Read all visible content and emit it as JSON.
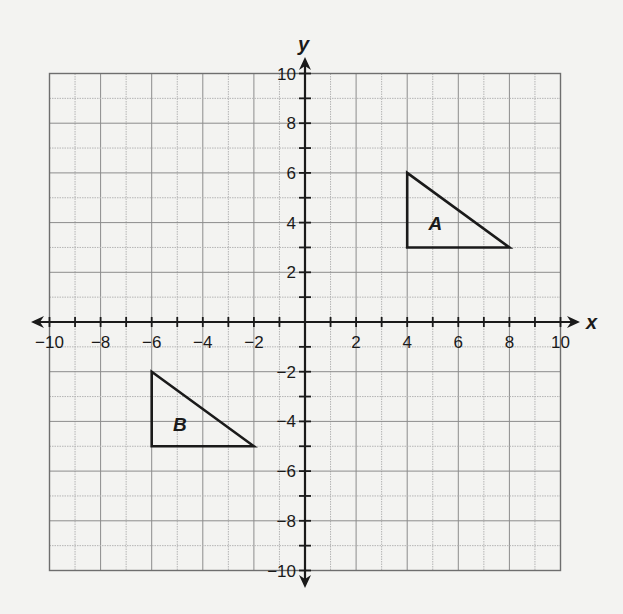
{
  "diagram": {
    "type": "coordinate-plane",
    "x_axis": {
      "label": "x",
      "min": -10,
      "max": 10,
      "tick_step": 1,
      "label_step": 2,
      "tick_labels": [
        "−10",
        "−8",
        "−6",
        "−4",
        "−2",
        "2",
        "4",
        "6",
        "8",
        "10"
      ]
    },
    "y_axis": {
      "label": "y",
      "min": -10,
      "max": 10,
      "tick_step": 1,
      "label_step": 2,
      "tick_labels": [
        "10",
        "8",
        "6",
        "4",
        "2",
        "−2",
        "−4",
        "−6",
        "−8",
        "−10"
      ]
    },
    "grid": true,
    "shapes": [
      {
        "name": "A",
        "type": "triangle",
        "vertices": [
          [
            4,
            6
          ],
          [
            4,
            3
          ],
          [
            8,
            3
          ]
        ],
        "label_pos": [
          5.1,
          4.0
        ]
      },
      {
        "name": "B",
        "type": "triangle",
        "vertices": [
          [
            -6,
            -2
          ],
          [
            -6,
            -5
          ],
          [
            -2,
            -5
          ]
        ],
        "label_pos": [
          -4.9,
          -4.1
        ]
      }
    ],
    "colors": {
      "background": "#f3f3f1",
      "grid_major": "#8c8c8c",
      "grid_minor": "#b4b4b4",
      "ink": "#1a1a1a"
    }
  }
}
